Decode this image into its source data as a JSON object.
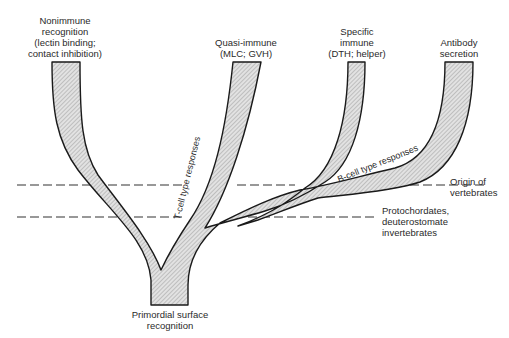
{
  "diagram": {
    "type": "phylogenetic-tree",
    "colors": {
      "branch_fill": "#cfcfcf",
      "branch_stroke": "#1a1a1a",
      "dash": "#333333"
    },
    "labels": {
      "nonimmune": {
        "line1": "Nonimmune",
        "line2": "recognition",
        "line3": "(lectin binding;",
        "line4": "contact inhibition)"
      },
      "quasi_immune": {
        "line1": "Quasi-immune",
        "line2": "(MLC; GVH)"
      },
      "specific_immune": {
        "line1": "Specific",
        "line2": "immune",
        "line3": "(DTH; helper)"
      },
      "antibody": {
        "line1": "Antibody",
        "line2": "secretion"
      },
      "root": {
        "line1": "Primordial surface",
        "line2": "recognition"
      },
      "vertebrates": {
        "line1": "Origin of",
        "line2": "vertebrates"
      },
      "protochordates": {
        "line1": "Protochordates,",
        "line2": "deuterostomate",
        "line3": "invertebrates"
      },
      "t_cell": "T-cell type responses",
      "b_cell": "B-cell type responses"
    }
  }
}
